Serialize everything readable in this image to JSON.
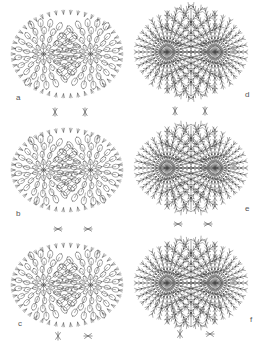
{
  "figure": {
    "panels": [
      {
        "id": "a",
        "label": "a",
        "style": "rosette",
        "cx": 67,
        "cy": 54,
        "rx": 56,
        "ry": 44,
        "label_x": 16,
        "label_y": 97,
        "stars": [
          [
            55,
            112
          ],
          [
            85,
            112
          ]
        ],
        "star_style": "vertical"
      },
      {
        "id": "b",
        "label": "b",
        "style": "rosette",
        "cx": 67,
        "cy": 170,
        "rx": 56,
        "ry": 42,
        "label_x": 16,
        "label_y": 213,
        "stars": [
          [
            58,
            229
          ],
          [
            88,
            229
          ]
        ],
        "star_style": "horizontal"
      },
      {
        "id": "c",
        "label": "c",
        "style": "rosette",
        "cx": 67,
        "cy": 285,
        "rx": 56,
        "ry": 42,
        "label_x": 18,
        "label_y": 323,
        "stars": [
          [
            58,
            336
          ],
          [
            88,
            336
          ]
        ],
        "star_style": "mixed"
      },
      {
        "id": "d",
        "label": "d",
        "style": "radial",
        "cx": 191,
        "cy": 52,
        "rx": 57,
        "ry": 47,
        "label_x": 245,
        "label_y": 94,
        "stars": [
          [
            175,
            111
          ],
          [
            205,
            111
          ]
        ],
        "star_style": "vertical"
      },
      {
        "id": "e",
        "label": "e",
        "style": "radial",
        "cx": 191,
        "cy": 168,
        "rx": 57,
        "ry": 45,
        "label_x": 245,
        "label_y": 208,
        "stars": [
          [
            178,
            224
          ],
          [
            208,
            224
          ]
        ],
        "star_style": "horizontal"
      },
      {
        "id": "f",
        "label": "f",
        "style": "radial",
        "cx": 191,
        "cy": 283,
        "rx": 57,
        "ry": 46,
        "label_x": 250,
        "label_y": 319,
        "stars": [
          [
            180,
            334
          ],
          [
            210,
            334
          ]
        ],
        "star_style": "mixed"
      }
    ],
    "colors": {
      "line": "#4a4a4a",
      "label": "#555555",
      "background": "#ffffff"
    }
  }
}
